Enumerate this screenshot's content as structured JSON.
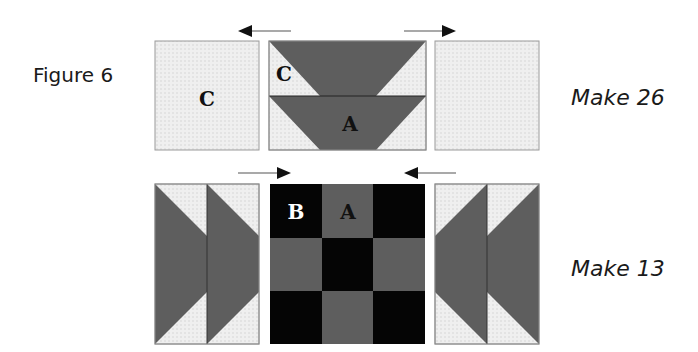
{
  "figure": {
    "title": "Figure 6",
    "colors": {
      "background": "#light",
      "light_fabric": "#ededed",
      "light_border": "#9a9a9a",
      "medium_fabric": "#5e5e5e",
      "dark_fabric": "#050505",
      "seam": "#222222",
      "arrow": "#111111"
    },
    "rows": [
      {
        "id": "row-1",
        "make_label": "Make 26",
        "units": [
          {
            "type": "square",
            "fabric": "light",
            "label": "C"
          },
          {
            "type": "flying-geese-pair",
            "fabric": "medium",
            "labels": [
              "C",
              "A"
            ]
          },
          {
            "type": "square",
            "fabric": "light",
            "label": ""
          }
        ],
        "arrows": [
          {
            "direction": "left"
          },
          {
            "direction": "right"
          }
        ]
      },
      {
        "id": "row-2",
        "make_label": "Make 13",
        "units": [
          {
            "type": "flying-geese-column",
            "fabric": "medium",
            "points": "right",
            "label": ""
          },
          {
            "type": "nine-patch",
            "fabric": "dark-medium",
            "labels": [
              "B",
              "A"
            ]
          },
          {
            "type": "flying-geese-column",
            "fabric": "medium",
            "points": "left",
            "label": ""
          }
        ],
        "arrows": [
          {
            "direction": "right"
          },
          {
            "direction": "left"
          }
        ]
      }
    ]
  }
}
